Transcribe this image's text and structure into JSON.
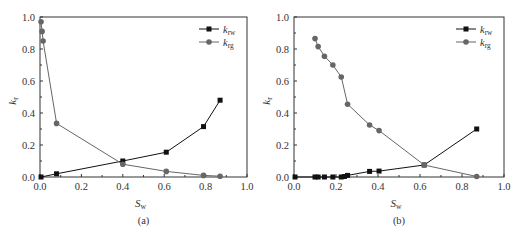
{
  "chart_data": [
    {
      "type": "line",
      "panel_label": "(a)",
      "xlabel": "S_w",
      "xlabel_main": "S",
      "xlabel_sub": "w",
      "ylabel": "k_r",
      "ylabel_main": "k",
      "ylabel_sub": "r",
      "xlim": [
        0.0,
        1.0
      ],
      "ylim": [
        0.0,
        1.0
      ],
      "xticks": [
        "0.0",
        "0.2",
        "0.4",
        "0.6",
        "0.8",
        "1.0"
      ],
      "yticks": [
        "0.0",
        "0.2",
        "0.4",
        "0.6",
        "0.8",
        "1.0"
      ],
      "grid": false,
      "legend_position": "upper right",
      "series": [
        {
          "name": "k_rw",
          "label_main": "k",
          "label_sub": "rw",
          "marker": "square",
          "color": "#111111",
          "x": [
            0.005,
            0.08,
            0.4,
            0.61,
            0.79,
            0.87
          ],
          "y": [
            0.0,
            0.02,
            0.1,
            0.155,
            0.315,
            0.48
          ]
        },
        {
          "name": "k_rg",
          "label_main": "k",
          "label_sub": "rg",
          "marker": "circle",
          "color": "#666666",
          "x": [
            0.005,
            0.01,
            0.015,
            0.08,
            0.4,
            0.61,
            0.79,
            0.87
          ],
          "y": [
            0.97,
            0.91,
            0.85,
            0.335,
            0.08,
            0.035,
            0.01,
            0.005
          ]
        }
      ]
    },
    {
      "type": "line",
      "panel_label": "(b)",
      "xlabel": "S_w",
      "xlabel_main": "S",
      "xlabel_sub": "w",
      "ylabel": "k_r",
      "ylabel_main": "k",
      "ylabel_sub": "r",
      "xlim": [
        0.0,
        1.0
      ],
      "ylim": [
        0.0,
        1.0
      ],
      "xticks": [
        "0.0",
        "0.2",
        "0.4",
        "0.6",
        "0.8",
        "1.0"
      ],
      "yticks": [
        "0.0",
        "0.2",
        "0.4",
        "0.6",
        "0.8",
        "1.0"
      ],
      "grid": false,
      "legend_position": "upper right",
      "series": [
        {
          "name": "k_rw",
          "label_main": "k",
          "label_sub": "rw",
          "marker": "square",
          "color": "#111111",
          "x": [
            0.005,
            0.1,
            0.115,
            0.145,
            0.185,
            0.225,
            0.24,
            0.255,
            0.36,
            0.405,
            0.62,
            0.87
          ],
          "y": [
            0.0,
            0.0,
            0.0,
            0.0,
            0.0,
            0.0,
            0.003,
            0.01,
            0.035,
            0.037,
            0.075,
            0.3
          ]
        },
        {
          "name": "k_rg",
          "label_main": "k",
          "label_sub": "rg",
          "marker": "circle",
          "color": "#666666",
          "x": [
            0.1,
            0.115,
            0.145,
            0.185,
            0.225,
            0.255,
            0.36,
            0.405,
            0.62,
            0.87
          ],
          "y": [
            0.865,
            0.815,
            0.755,
            0.7,
            0.625,
            0.455,
            0.325,
            0.29,
            0.075,
            0.003
          ]
        }
      ]
    }
  ]
}
